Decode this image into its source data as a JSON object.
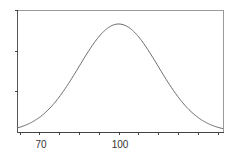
{
  "chart_data": {
    "type": "line",
    "title": "",
    "xlabel": "",
    "ylabel": "",
    "distribution": {
      "mean": 100,
      "sd": 15
    },
    "xlim": [
      61.5,
      139.5
    ],
    "ylim": [
      0,
      1.08
    ],
    "x_tick_labels": [
      {
        "value": 70,
        "label": "70"
      },
      {
        "value": 100,
        "label": "100"
      }
    ],
    "x_ticks": [
      62.5,
      70,
      77.5,
      85,
      92.5,
      100,
      107.5,
      115,
      122.5,
      130,
      137.5
    ],
    "y_ticks_fraction": [
      0.333,
      0.667,
      1.0
    ],
    "grid": false,
    "legend": null,
    "series": [
      {
        "name": "density",
        "x": [
          62,
          65,
          70,
          75,
          80,
          85,
          90,
          95,
          100,
          105,
          110,
          115,
          120,
          125,
          130,
          135,
          139
        ],
        "values": [
          0.04,
          0.07,
          0.14,
          0.25,
          0.41,
          0.61,
          0.8,
          0.95,
          1.0,
          0.95,
          0.8,
          0.61,
          0.41,
          0.25,
          0.14,
          0.07,
          0.04
        ]
      }
    ],
    "colors": {
      "curve": "#6a6a6a",
      "axis": "#555555",
      "frame": "#9a9a9a"
    }
  },
  "labels": {
    "x70": "70",
    "x100": "100"
  }
}
